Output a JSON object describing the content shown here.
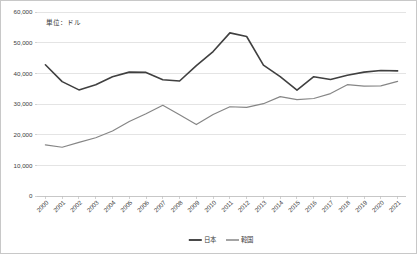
{
  "chart_data": {
    "type": "line",
    "title": "",
    "annotation": "単位：ドル",
    "xlabel": "",
    "ylabel": "",
    "ylim": [
      0,
      60000
    ],
    "ytick_labels": [
      "0",
      "10,000",
      "20,000",
      "30,000",
      "40,000",
      "50,000",
      "60,000"
    ],
    "ytick_values": [
      0,
      10000,
      20000,
      30000,
      40000,
      50000,
      60000
    ],
    "grid": true,
    "legend_position": "bottom",
    "categories": [
      "2000",
      "2001",
      "2002",
      "2003",
      "2004",
      "2005",
      "2006",
      "2007",
      "2008",
      "2009",
      "2010",
      "2011",
      "2012",
      "2013",
      "2014",
      "2015",
      "2016",
      "2017",
      "2018",
      "2019",
      "2020",
      "2021"
    ],
    "series": [
      {
        "name": "日本",
        "color": "#404040",
        "width": 1.6,
        "values": [
          42800,
          37300,
          34600,
          36300,
          38900,
          40400,
          40300,
          37900,
          37500,
          42500,
          47100,
          53200,
          52000,
          42700,
          38900,
          34500,
          38900,
          38000,
          39400,
          40400,
          40900,
          40800
        ]
      },
      {
        "name": "韓国",
        "color": "#868686",
        "width": 1.2,
        "values": [
          16700,
          15900,
          17500,
          19000,
          21200,
          24300,
          26800,
          29600,
          26500,
          23300,
          26600,
          29100,
          28900,
          30100,
          32400,
          31400,
          31800,
          33400,
          36300,
          35800,
          35900,
          37400
        ]
      }
    ]
  },
  "legend": {
    "items": [
      {
        "label": "日本"
      },
      {
        "label": "韓国"
      }
    ]
  },
  "annotation": {
    "unit_note": "単位：ドル"
  }
}
